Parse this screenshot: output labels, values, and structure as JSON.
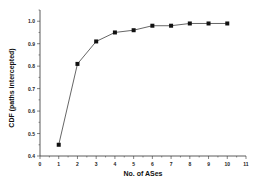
{
  "chart_data": {
    "type": "line",
    "title": "",
    "xlabel": "No. of ASes",
    "ylabel": "CDF (paths intercepted)",
    "x": [
      1,
      2,
      3,
      4,
      5,
      6,
      7,
      8,
      9,
      10
    ],
    "series": [
      {
        "name": "CDF",
        "values": [
          0.45,
          0.81,
          0.91,
          0.95,
          0.96,
          0.98,
          0.98,
          0.99,
          0.99,
          0.99
        ],
        "marker": "square",
        "color": "#555555"
      }
    ],
    "xlim": [
      0,
      11
    ],
    "ylim": [
      0.4,
      1.05
    ],
    "xticks": [
      0,
      1,
      2,
      3,
      4,
      5,
      6,
      7,
      8,
      9,
      10,
      11
    ],
    "yticks": [
      0.4,
      0.5,
      0.6,
      0.7,
      0.8,
      0.9,
      1.0
    ],
    "ytick_labels": [
      "0.4",
      "0.5",
      "0.6",
      "0.7",
      "0.8",
      "0.9",
      "1.0"
    ],
    "grid": false,
    "legend": null
  }
}
